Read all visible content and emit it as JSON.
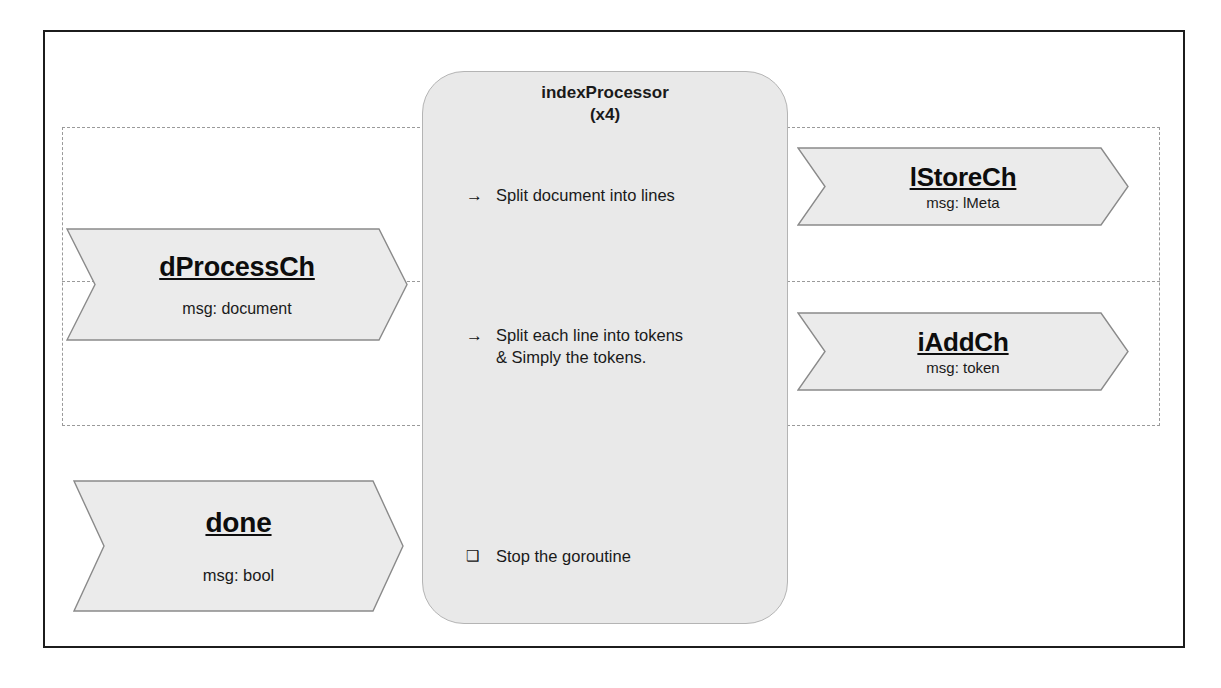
{
  "diagram": {
    "colors": {
      "frame_border": "#1c1c1c",
      "dashed_border": "#9a9a9a",
      "box_fill": "#e9e9e9",
      "box_border": "#b4b4b4",
      "arrow_fill": "#ebebeb",
      "arrow_border": "#8a8a8a",
      "text": "#1a1a1a"
    }
  },
  "processor": {
    "name": "indexProcessor",
    "multiplicity": "(x4)",
    "title_block": "indexProcessor\n(x4)",
    "tasks": [
      {
        "bullet": "arrow-right-icon",
        "glyph": "→",
        "text": "Split document into lines"
      },
      {
        "bullet": "arrow-right-icon",
        "glyph": "→",
        "text": "Split each line into tokens\n& Simply the tokens."
      },
      {
        "bullet": "checkbox-square-icon",
        "glyph": "❑",
        "text": "Stop the goroutine"
      }
    ]
  },
  "channels": {
    "input": [
      {
        "name": "dProcessCh",
        "message": "msg: document"
      },
      {
        "name": "done",
        "message": "msg: bool"
      }
    ],
    "output": [
      {
        "name": "lStoreCh",
        "message": "msg: lMeta"
      },
      {
        "name": "iAddCh",
        "message": "msg: token"
      }
    ]
  }
}
